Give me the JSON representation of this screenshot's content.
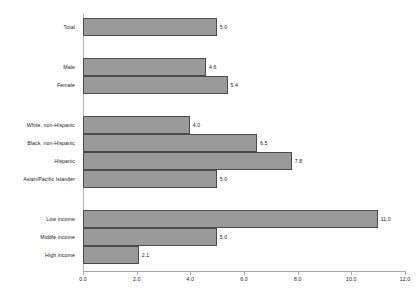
{
  "chart_data": {
    "type": "bar",
    "orientation": "horizontal",
    "title": "",
    "xlabel": "",
    "ylabel": "",
    "xlim": [
      0.0,
      12.0
    ],
    "xticks": [
      "0.0",
      "2.0",
      "4.0",
      "6.0",
      "8.0",
      "10.0",
      "12.0"
    ],
    "xtick_values": [
      0.0,
      2.0,
      4.0,
      6.0,
      8.0,
      10.0,
      12.0
    ],
    "grid": false,
    "legend": false,
    "bar_color": "#9a9a9a",
    "bar_border_color": "#4a4a4a",
    "axis_color": "#a8a8a8",
    "categories": [
      "Total",
      "Male",
      "Female",
      "White, non-Hispanic",
      "Black, non-Hispanic",
      "Hispanic",
      "Asian/Pacific Islander",
      "Low income",
      "Middle income",
      "High income"
    ],
    "values": [
      5.0,
      4.6,
      5.4,
      4.0,
      6.5,
      7.8,
      5.0,
      11.0,
      5.0,
      2.1
    ],
    "value_labels": [
      "5.0",
      "4.6",
      "5.4",
      "4.0",
      "6.5",
      "7.8",
      "5.0",
      "11.0",
      "5.0",
      "2.1"
    ],
    "groups": [
      {
        "name": "overall",
        "categories": [
          "Total"
        ]
      },
      {
        "name": "sex",
        "categories": [
          "Male",
          "Female"
        ]
      },
      {
        "name": "race-ethnicity",
        "categories": [
          "White, non-Hispanic",
          "Black, non-Hispanic",
          "Hispanic",
          "Asian/Pacific Islander"
        ]
      },
      {
        "name": "income",
        "categories": [
          "Low income",
          "Middle income",
          "High income"
        ]
      }
    ],
    "bars": [
      {
        "category": "Total",
        "value": 5.0,
        "label": "5.0",
        "group": "overall"
      },
      {
        "category": "Male",
        "value": 4.6,
        "label": "4.6",
        "group": "sex"
      },
      {
        "category": "Female",
        "value": 5.4,
        "label": "5.4",
        "group": "sex"
      },
      {
        "category": "White, non-Hispanic",
        "value": 4.0,
        "label": "4.0",
        "group": "race-ethnicity"
      },
      {
        "category": "Black, non-Hispanic",
        "value": 6.5,
        "label": "6.5",
        "group": "race-ethnicity"
      },
      {
        "category": "Hispanic",
        "value": 7.8,
        "label": "7.8",
        "group": "race-ethnicity"
      },
      {
        "category": "Asian/Pacific Islander",
        "value": 5.0,
        "label": "5.0",
        "group": "race-ethnicity"
      },
      {
        "category": "Low income",
        "value": 11.0,
        "label": "11.0",
        "group": "income"
      },
      {
        "category": "Middle income",
        "value": 5.0,
        "label": "5.0",
        "group": "income"
      },
      {
        "category": "High income",
        "value": 2.1,
        "label": "2.1",
        "group": "income"
      }
    ]
  }
}
